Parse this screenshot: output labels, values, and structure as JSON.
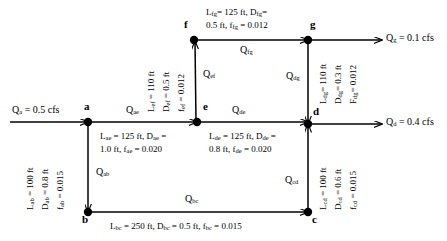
{
  "figure": {
    "type": "pipe-network-diagram",
    "width": 447,
    "height": 241,
    "background": "#ffffff",
    "line_color": "#000000"
  },
  "nodes": [
    {
      "id": "a",
      "label": "a",
      "x": 88,
      "y": 122
    },
    {
      "id": "b",
      "label": "b",
      "x": 88,
      "y": 212
    },
    {
      "id": "c",
      "label": "c",
      "x": 308,
      "y": 212
    },
    {
      "id": "d",
      "label": "d",
      "x": 308,
      "y": 124
    },
    {
      "id": "e",
      "label": "e",
      "x": 197,
      "y": 122
    },
    {
      "id": "f",
      "label": "f",
      "x": 194,
      "y": 40
    },
    {
      "id": "g",
      "label": "g",
      "x": 308,
      "y": 40
    }
  ],
  "pipes": [
    {
      "id": "ab",
      "from": "a",
      "to": "b",
      "flow_label": "Qab",
      "spec": "Lab = 100 ft, Dab = 0.8 ft, fab = 0.015",
      "length": "100 ft",
      "diameter": "0.8 ft",
      "friction": "0.015",
      "line1": "L",
      "sub1": "ab",
      "v1": " = 100 ft",
      "line2": "D",
      "sub2": "ab",
      "v2": " = 0.8 ft",
      "line3": "f",
      "sub3": "ab",
      "v3": " = 0.015"
    },
    {
      "id": "bc",
      "from": "b",
      "to": "c",
      "flow_label": "Qbc",
      "spec": "Lbc = 250 ft, Dbc = 0.5 ft, fbc = 0.015",
      "length": "250 ft",
      "diameter": "0.5 ft",
      "friction": "0.015"
    },
    {
      "id": "cd",
      "from": "c",
      "to": "d",
      "flow_label": "Qcd",
      "spec": "Lcd = 100 ft, Dcd = 0.6 ft, fcd = 0.015",
      "length": "100 ft",
      "diameter": "0.6 ft",
      "friction": "0.015"
    },
    {
      "id": "ae",
      "from": "a",
      "to": "e",
      "flow_label": "Qae",
      "spec": "Lae = 125 ft, Dae = 1.0 ft, fae = 0.020",
      "length": "125 ft",
      "diameter": "1.0 ft",
      "friction": "0.020"
    },
    {
      "id": "de",
      "from": "e",
      "to": "d",
      "flow_label": "Qde",
      "spec": "Lde = 125 ft, Dde = 0.8 ft, fde = 0.020",
      "length": "125 ft",
      "diameter": "0.8 ft",
      "friction": "0.020"
    },
    {
      "id": "ef",
      "from": "e",
      "to": "f",
      "flow_label": "Qef",
      "spec": "Lef = 110 ft, Def = 0.5 ft, fef = 0.012",
      "length": "110 ft",
      "diameter": "0.5 ft",
      "friction": "0.012"
    },
    {
      "id": "fg",
      "from": "f",
      "to": "g",
      "flow_label": "Qfg",
      "spec": "Lfg = 125 ft, Dfg = 0.5 ft, ffg = 0.012",
      "length": "125 ft",
      "diameter": "0.5 ft",
      "friction": "0.012"
    },
    {
      "id": "dg",
      "from": "g",
      "to": "d",
      "flow_label": "Qdg",
      "spec": "Ldg = 110 ft, Ddg = 0.3 ft, Fdg = 0.012",
      "length": "110 ft",
      "diameter": "0.3 ft",
      "friction": "0.012"
    }
  ],
  "labels": {
    "pipe_ab": {
      "l": "L",
      "l_sub": "ab",
      "l_val": " = 100 ft",
      "d": "D",
      "d_sub": "ab",
      "d_val": " = 0.8 ft",
      "f": "f",
      "f_sub": "ab",
      "f_val": " = 0.015"
    },
    "pipe_bc_text": "L",
    "pipe_bc": {
      "part1": "L",
      "sub1": "bc",
      "mid1": " = 250 ft, D",
      "sub2": "bc",
      "mid2": " = 0.5 ft, f",
      "sub3": "bc",
      "mid3": " = 0.015"
    },
    "pipe_cd": {
      "l": "L",
      "l_sub": "cd",
      "l_val": " = 100 ft",
      "d": "D",
      "d_sub": "cd",
      "d_val": " = 0.6 ft",
      "f": "f",
      "f_sub": "cd",
      "f_val": " = 0.015"
    },
    "pipe_ae_line1": {
      "p1": "L",
      "s1": "ae",
      "p2": " = 125 ft, D",
      "s2": "ae",
      "p3": " ="
    },
    "pipe_ae_line2": {
      "p1": "1.0 ft, f",
      "s1": "ae",
      "p2": " = 0.020"
    },
    "pipe_de_line1": {
      "p1": "L",
      "s1": "de",
      "p2": " = 125 ft, D",
      "s2": "de",
      "p3": " ="
    },
    "pipe_de_line2": {
      "p1": "0.8 ft, f",
      "s1": "de",
      "p2": " = 0.020"
    },
    "pipe_ef": {
      "l": "L",
      "l_sub": "ef",
      "l_val": " = 110 ft",
      "d": "D",
      "d_sub": "ef",
      "d_val": " = 0.5 ft",
      "f": "f",
      "f_sub": "ef",
      "f_val": " = 0.012"
    },
    "pipe_fg_line1": {
      "p1": "L",
      "s1": "fg",
      "p2": "= 125 ft, D",
      "s2": "fg",
      "p3": "="
    },
    "pipe_fg_line2": {
      "p1": "0.5 ft, f",
      "s1": "fg",
      "p2": " = 0.012"
    },
    "pipe_dg": {
      "l": "L",
      "l_sub": "dg",
      "l_val": "= 110 ft",
      "d": "D",
      "d_sub": "dg",
      "d_val": "= 0.3 ft",
      "f": "F",
      "f_sub": "dg",
      "f_val": "= 0.012"
    }
  },
  "flows": {
    "q_ab": {
      "q": "Q",
      "sub": "ab"
    },
    "q_bc": {
      "q": "Q",
      "sub": "bc"
    },
    "q_cd": {
      "q": "Q",
      "sub": "cd"
    },
    "q_ae": {
      "q": "Q",
      "sub": "ae"
    },
    "q_de": {
      "q": "Q",
      "sub": "de"
    },
    "q_ef": {
      "q": "Q",
      "sub": "ef"
    },
    "q_fg": {
      "q": "Q",
      "sub": "fg"
    },
    "q_dg": {
      "q": "Q",
      "sub": "dg"
    }
  },
  "external_flows": [
    {
      "id": "Qa",
      "q": "Q",
      "sub": "a",
      "value": " = 0.5 cfs",
      "direction": "inflow",
      "at_node": "a",
      "text": "Qa = 0.5 cfs"
    },
    {
      "id": "Qg",
      "q": "Q",
      "sub": "g",
      "value": " = 0.1 cfs",
      "direction": "outflow",
      "at_node": "g",
      "text": "Qg = 0.1 cfs"
    },
    {
      "id": "Qd",
      "q": "Q",
      "sub": "d",
      "value": " = 0.4 cfs",
      "direction": "outflow",
      "at_node": "d",
      "text": "Qd = 0.4 cfs"
    }
  ],
  "node_labels": {
    "a": "a",
    "b": "b",
    "c": "c",
    "d": "d",
    "e": "e",
    "f": "f",
    "g": "g"
  }
}
